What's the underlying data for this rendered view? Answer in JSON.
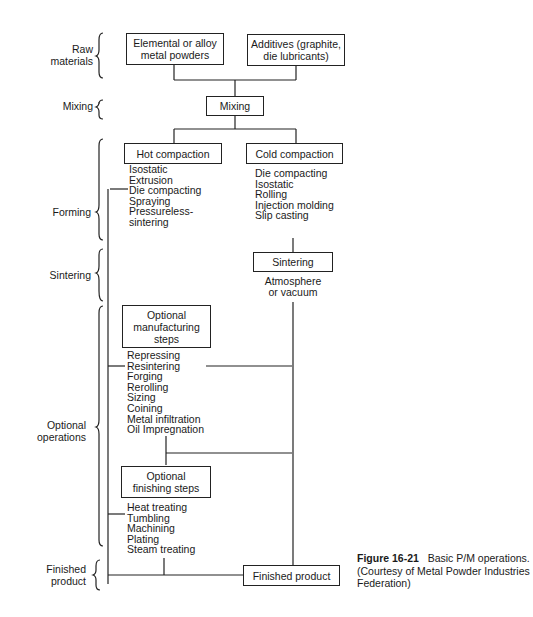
{
  "stages": [
    {
      "id": "raw-materials",
      "label": "Raw\nmaterials"
    },
    {
      "id": "mixing",
      "label": "Mixing"
    },
    {
      "id": "forming",
      "label": "Forming"
    },
    {
      "id": "sintering",
      "label": "Sintering"
    },
    {
      "id": "optional-operations",
      "label": "Optional\noperations"
    },
    {
      "id": "finished-product",
      "label": "Finished\nproduct"
    }
  ],
  "boxes": {
    "elemental": "Elemental or alloy\nmetal powders",
    "additives": "Additives (graphite,\ndie lubricants)",
    "mixing": "Mixing",
    "hot_compaction": "Hot compaction",
    "cold_compaction": "Cold compaction",
    "sintering": "Sintering",
    "optional_manufacturing": "Optional\nmanufacturing\nsteps",
    "optional_finishing": "Optional\nfinishing steps",
    "finished_product": "Finished product"
  },
  "lists": {
    "hot_compaction": [
      "Isostatic",
      "Extrusion",
      "Die compacting",
      "Spraying",
      "Pressureless-",
      "sintering"
    ],
    "cold_compaction": [
      "Die compacting",
      "Isostatic",
      "Rolling",
      "Injection molding",
      "Slip casting"
    ],
    "sintering": [
      "Atmosphere",
      "or vacuum"
    ],
    "optional_manufacturing": [
      "Repressing",
      "Resintering",
      "Forging",
      "Rerolling",
      "Sizing",
      "Coining",
      "Metal infiltration",
      "Oil Impregnation"
    ],
    "optional_finishing": [
      "Heat treating",
      "Tumbling",
      "Machining",
      "Plating",
      "Steam treating"
    ]
  },
  "caption": {
    "figure_number": "Figure 16-21",
    "title": "Basic P/M operations.",
    "credit": "(Courtesy of Metal Powder Industries Federation)"
  }
}
